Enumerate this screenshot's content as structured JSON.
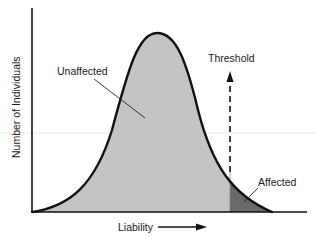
{
  "diagram": {
    "type": "liability-threshold-model",
    "y_axis_label": "Number of Individuals",
    "x_axis_label": "Liability",
    "threshold_label": "Threshold",
    "region_labels": {
      "unaffected": "Unaffected",
      "affected": "Affected"
    },
    "colors": {
      "background": "#ffffff",
      "axis": "#111111",
      "curve": "#111111",
      "unaffected_fill": "#c4c4c4",
      "affected_fill": "#6a6a6a",
      "text": "#1a1a1a",
      "scan_line": "#e6e6e6"
    },
    "curve": {
      "shape": "bell (normal distribution)",
      "start_px": [
        33,
        212
      ],
      "peak_px": [
        157,
        33
      ],
      "end_px": [
        272,
        212
      ]
    },
    "threshold": {
      "x_px": 230,
      "arrow_direction": "up",
      "line_style": "dashed"
    }
  }
}
